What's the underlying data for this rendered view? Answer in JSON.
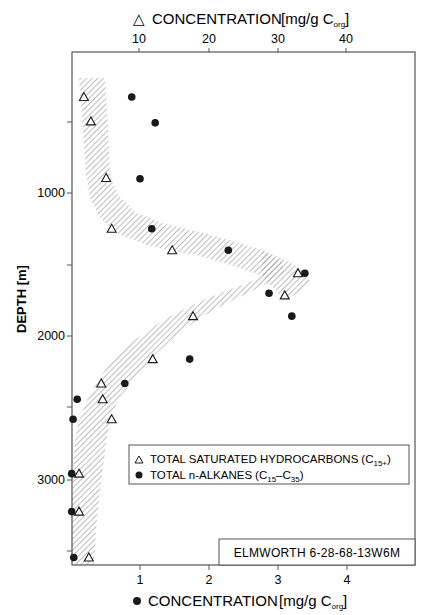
{
  "chart_data": {
    "type": "scatter",
    "title": "",
    "orientation": "depth-profile (y inverted)",
    "ylabel": "DEPTH [m]",
    "ylim": [
      0,
      3600
    ],
    "yticks_labeled": [
      1000,
      2000,
      3000
    ],
    "yticks_minor": [
      500,
      1500,
      2500,
      3500
    ],
    "x_top": {
      "label_symbol": "△",
      "label": "CONCENTRATION",
      "unit_prefix": "[mg/g C",
      "unit_sub": "org",
      "unit_suffix": "]",
      "ticks": [
        10,
        20,
        30,
        40
      ],
      "range": [
        0,
        49.5
      ]
    },
    "x_bottom": {
      "label_symbol": "●",
      "label": "CONCENTRATION",
      "unit_prefix": "[mg/g C",
      "unit_sub": "org",
      "unit_suffix": "]",
      "ticks": [
        1,
        2,
        3,
        4
      ],
      "range": [
        0,
        4.98
      ]
    },
    "series": [
      {
        "name": "TOTAL SATURATED HYDROCARBONS (C15+)",
        "marker": "open-triangle",
        "axis": "top",
        "points": [
          {
            "x": 2.0,
            "depth": 330
          },
          {
            "x": 3.0,
            "depth": 500
          },
          {
            "x": 5.2,
            "depth": 895
          },
          {
            "x": 6.0,
            "depth": 1250
          },
          {
            "x": 14.7,
            "depth": 1400
          },
          {
            "x": 32.8,
            "depth": 1560
          },
          {
            "x": 30.9,
            "depth": 1715
          },
          {
            "x": 17.7,
            "depth": 1860
          },
          {
            "x": 11.9,
            "depth": 2160
          },
          {
            "x": 4.5,
            "depth": 2330
          },
          {
            "x": 4.7,
            "depth": 2440
          },
          {
            "x": 6.0,
            "depth": 2580
          },
          {
            "x": 1.3,
            "depth": 2960
          },
          {
            "x": 1.3,
            "depth": 3225
          },
          {
            "x": 2.7,
            "depth": 3545
          }
        ]
      },
      {
        "name": "TOTAL n-ALKANES (C15-C35)",
        "marker": "filled-circle",
        "axis": "bottom",
        "points": [
          {
            "x": 0.88,
            "depth": 330
          },
          {
            "x": 1.22,
            "depth": 510
          },
          {
            "x": 1.0,
            "depth": 900
          },
          {
            "x": 1.17,
            "depth": 1250
          },
          {
            "x": 2.28,
            "depth": 1400
          },
          {
            "x": 3.39,
            "depth": 1560
          },
          {
            "x": 2.87,
            "depth": 1700
          },
          {
            "x": 3.2,
            "depth": 1860
          },
          {
            "x": 1.72,
            "depth": 2160
          },
          {
            "x": 0.78,
            "depth": 2330
          },
          {
            "x": 0.09,
            "depth": 2440
          },
          {
            "x": 0.03,
            "depth": 2580
          },
          {
            "x": 0.01,
            "depth": 2960
          },
          {
            "x": 0.01,
            "depth": 3225
          },
          {
            "x": 0.04,
            "depth": 3545
          }
        ]
      }
    ],
    "shaded_band": "hatched envelope following the saturated hydrocarbon trend, peaking near 1600 m",
    "legend": {
      "position": "lower-right inside plot",
      "entries": [
        {
          "symbol": "△",
          "text": "TOTAL SATURATED HYDROCARBONS",
          "paren_open": "(C",
          "sub": "15+",
          "paren_close": ")"
        },
        {
          "symbol": "●",
          "text": "TOTAL n-ALKANES",
          "paren_open": "(C",
          "sub": "15",
          "mid": "–C",
          "sub2": "35",
          "paren_close": ")"
        }
      ]
    },
    "annotation": "ELMWORTH 6-28-68-13W6M",
    "grid": false
  },
  "labels": {
    "top_axis_title": "CONCENTRATION",
    "bottom_axis_title": "CONCENTRATION",
    "depth_axis_title": "DEPTH [m]",
    "unit_open": "[mg/g C",
    "unit_sub": "org",
    "unit_close": "]",
    "well_id": "ELMWORTH 6-28-68-13W6M",
    "legend_sat": "TOTAL SATURATED HYDROCARBONS",
    "legend_sat_paren": "(C",
    "legend_sat_sub": "15+",
    "legend_sat_close": ")",
    "legend_alk": "TOTAL n-ALKANES",
    "legend_alk_paren": "(C",
    "legend_alk_sub1": "15",
    "legend_alk_mid": "–C",
    "legend_alk_sub2": "35",
    "legend_alk_close": ")",
    "top_ticks": [
      "10",
      "20",
      "30",
      "40"
    ],
    "bottom_ticks": [
      "1",
      "2",
      "3",
      "4"
    ],
    "depth_ticks": [
      "1000",
      "2000",
      "3000"
    ]
  },
  "colors": {
    "ink": "#1a1a1a",
    "frame": "#555555",
    "hatch": "#9a9a9a",
    "background": "#ffffff"
  }
}
